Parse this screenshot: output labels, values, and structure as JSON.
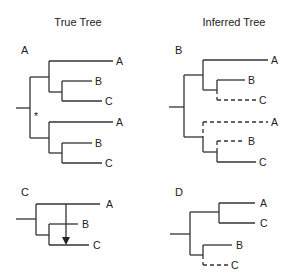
{
  "titles": {
    "left": "True Tree",
    "right": "Inferred Tree"
  },
  "panels": {
    "A": {
      "label": "A",
      "column": "True Tree",
      "leaves": [
        "A",
        "B",
        "C",
        "A",
        "B",
        "C"
      ],
      "annotation": "*"
    },
    "B": {
      "label": "B",
      "column": "Inferred Tree",
      "leaves": [
        "A",
        "B",
        "C",
        "A",
        "B",
        "C"
      ],
      "dashed_branches": [
        "C (upper clade)",
        "A (lower clade)",
        "B (lower clade)"
      ]
    },
    "C": {
      "label": "C",
      "column": "True Tree",
      "leaves": [
        "A",
        "B",
        "C"
      ],
      "annotation": "arrow from A branch to C branch (horizontal transfer)"
    },
    "D": {
      "label": "D",
      "column": "Inferred Tree",
      "leaves": [
        "A",
        "C",
        "B",
        "C"
      ],
      "dashed_branches": [
        "C (lower clade)"
      ]
    }
  },
  "colors": {
    "line": "#333333",
    "text": "#222222",
    "background": "#ffffff"
  }
}
